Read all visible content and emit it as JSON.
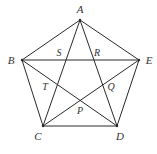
{
  "figure": {
    "type": "pentagon-with-pentagram",
    "vertices": [
      {
        "name": "A",
        "x": 80,
        "y": 20,
        "label_x": 80,
        "label_y": 10
      },
      {
        "name": "B",
        "x": 22,
        "y": 60,
        "label_x": 11,
        "label_y": 61
      },
      {
        "name": "C",
        "x": 43,
        "y": 126,
        "label_x": 38,
        "label_y": 137
      },
      {
        "name": "D",
        "x": 117,
        "y": 126,
        "label_x": 120,
        "label_y": 137
      },
      {
        "name": "E",
        "x": 139,
        "y": 60,
        "label_x": 149,
        "label_y": 61
      }
    ],
    "intersections": [
      {
        "name": "S",
        "label_x": 59,
        "label_y": 54
      },
      {
        "name": "R",
        "label_x": 97,
        "label_y": 54
      },
      {
        "name": "Q",
        "label_x": 111,
        "label_y": 88
      },
      {
        "name": "P",
        "label_x": 80,
        "label_y": 112
      },
      {
        "name": "T",
        "label_x": 45,
        "label_y": 88
      }
    ],
    "pentagon_edges": [
      "AB",
      "BC",
      "CD",
      "DE",
      "EA"
    ],
    "diagonals": [
      "AC",
      "AD",
      "BE",
      "BD",
      "CE"
    ],
    "colors": {
      "stroke": "#2a2a2a",
      "label": "#333333",
      "background": "#ffffff"
    }
  }
}
